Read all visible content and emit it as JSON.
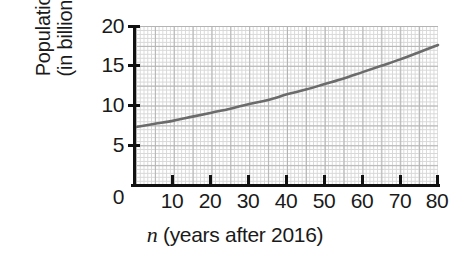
{
  "chart_data": {
    "type": "line",
    "title": "",
    "xlabel": "n (years after 2016)",
    "xlabel_variable": "n",
    "xlabel_rest": " (years after 2016)",
    "ylabel_line1": "Population",
    "ylabel_line2": "(in billions)",
    "ylabel": "Population (in billions)",
    "xlim": [
      0,
      80
    ],
    "ylim": [
      0,
      20
    ],
    "grid": true,
    "legend": null,
    "series_color": "#6b6b6b",
    "x_ticks": [
      0,
      10,
      20,
      30,
      40,
      50,
      60,
      70,
      80
    ],
    "x_tick_labels": [
      "0",
      "10",
      "20",
      "30",
      "40",
      "50",
      "60",
      "70",
      "80"
    ],
    "y_ticks": [
      0,
      5,
      10,
      15,
      20
    ],
    "y_tick_labels": [
      "0",
      "5",
      "10",
      "15",
      "20"
    ],
    "series": [
      {
        "name": "Population",
        "x": [
          0,
          5,
          10,
          15,
          20,
          25,
          30,
          35,
          40,
          45,
          50,
          55,
          60,
          65,
          70,
          75,
          80
        ],
        "values": [
          7.3,
          7.7,
          8.1,
          8.6,
          9.1,
          9.6,
          10.2,
          10.7,
          11.4,
          12.0,
          12.7,
          13.4,
          14.2,
          15.0,
          15.8,
          16.7,
          17.6
        ]
      }
    ]
  },
  "axes": {
    "y_title_line1": "Population",
    "y_title_line2": "(in billions)",
    "y_tick_20": "20",
    "y_tick_15": "15",
    "y_tick_10": "10",
    "y_tick_5": "5",
    "y_tick_0": "0",
    "x_tick_10": "10",
    "x_tick_20": "20",
    "x_tick_30": "30",
    "x_tick_40": "40",
    "x_tick_50": "50",
    "x_tick_60": "60",
    "x_tick_70": "70",
    "x_tick_80": "80",
    "x_title_variable": "n",
    "x_title_rest": " (years after 2016)"
  }
}
